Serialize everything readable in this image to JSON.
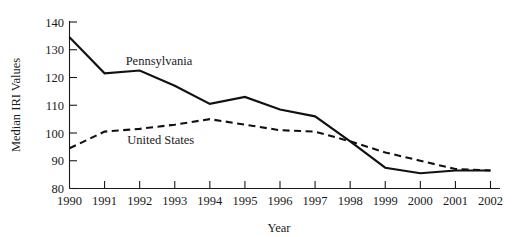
{
  "chart_data": {
    "type": "line",
    "title": "",
    "xlabel": "Year",
    "ylabel": "Median IRI Values",
    "x": [
      1990,
      1991,
      1992,
      1993,
      1994,
      1995,
      1996,
      1997,
      1998,
      1999,
      2000,
      2001,
      2002
    ],
    "xtick_labels": [
      "1990",
      "1991",
      "1992",
      "1993",
      "1994",
      "1995",
      "1996",
      "1997",
      "1998",
      "1999",
      "2000",
      "2001",
      "2002"
    ],
    "ytick_labels": [
      "80",
      "90",
      "100",
      "110",
      "120",
      "130",
      "140"
    ],
    "yticks": [
      80,
      90,
      100,
      110,
      120,
      130,
      140
    ],
    "xlim": [
      1990,
      2002
    ],
    "ylim": [
      80,
      140
    ],
    "grid": false,
    "legend_position": "inline-annotation",
    "series": [
      {
        "name": "Pennsylvania",
        "style": "solid",
        "color": "#111111",
        "label_x": 1992.55,
        "label_y": 124.5,
        "values": [
          134.5,
          121.5,
          122.5,
          117.0,
          110.5,
          113.0,
          108.5,
          106.0,
          97.0,
          87.5,
          85.5,
          86.5,
          86.5
        ]
      },
      {
        "name": "United States",
        "style": "dashed",
        "color": "#111111",
        "label_x": 1992.6,
        "label_y": 96.0,
        "values": [
          94.5,
          100.5,
          101.5,
          103.0,
          105.0,
          103.0,
          101.0,
          100.5,
          97.0,
          93.0,
          90.0,
          87.0,
          86.5
        ]
      }
    ]
  },
  "axes": {
    "y_axis_title": "Median IRI Values",
    "x_axis_title": "Year"
  }
}
